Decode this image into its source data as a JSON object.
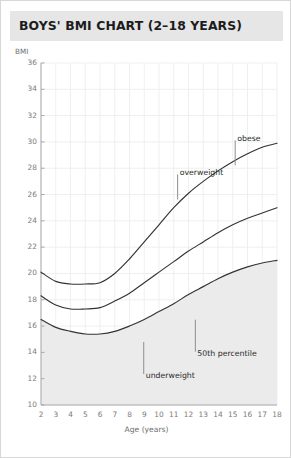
{
  "header": {
    "title": "BOYS' BMI CHART (2–18 YEARS)",
    "band_color": "#e6e6e6"
  },
  "chart_data": {
    "type": "line",
    "title": "BOYS' BMI CHART (2–18 YEARS)",
    "xlabel": "Age (years)",
    "ylabel": "BMI",
    "xlim": [
      2,
      18
    ],
    "ylim": [
      10,
      36
    ],
    "grid": true,
    "grid_color": "#efefef",
    "legend": "none",
    "x_ticks": [
      2,
      3,
      4,
      5,
      6,
      7,
      8,
      9,
      10,
      11,
      12,
      13,
      14,
      15,
      16,
      17,
      18
    ],
    "y_ticks": [
      10,
      12,
      14,
      16,
      18,
      20,
      22,
      24,
      26,
      28,
      30,
      32,
      34,
      36
    ],
    "x": [
      2,
      3,
      4,
      5,
      6,
      7,
      8,
      9,
      10,
      11,
      12,
      13,
      14,
      15,
      16,
      17,
      18
    ],
    "series": [
      {
        "name": "obese",
        "label": "obese",
        "color": "#333333",
        "values": [
          20.1,
          19.4,
          19.2,
          19.2,
          19.3,
          20.0,
          21.1,
          22.4,
          23.7,
          25.0,
          26.1,
          27.0,
          27.8,
          28.5,
          29.1,
          29.6,
          29.9
        ]
      },
      {
        "name": "overweight",
        "label": "overweight",
        "color": "#333333",
        "values": [
          18.3,
          17.6,
          17.3,
          17.3,
          17.4,
          17.9,
          18.5,
          19.3,
          20.1,
          20.9,
          21.7,
          22.4,
          23.1,
          23.7,
          24.2,
          24.6,
          25.0
        ]
      },
      {
        "name": "50th percentile",
        "label": "50th percentile",
        "color": "#333333",
        "values": [
          16.5,
          15.9,
          15.6,
          15.4,
          15.4,
          15.6,
          16.0,
          16.5,
          17.1,
          17.7,
          18.4,
          19.0,
          19.6,
          20.1,
          20.5,
          20.8,
          21.0
        ]
      }
    ],
    "bands": [
      {
        "name": "underweight-band",
        "label": "underweight",
        "fill": "#ebebeb",
        "description": "shaded region below the 50th percentile curve"
      }
    ],
    "annotations": [
      {
        "name": "obese",
        "text": "obese",
        "x": 15.3,
        "y": 30.2,
        "leader": "down"
      },
      {
        "name": "overweight",
        "text": "overweight",
        "x": 11.4,
        "y": 27.6,
        "leader": "down"
      },
      {
        "name": "50th-percentile",
        "text": "50th percentile",
        "x": 12.6,
        "y": 13.9,
        "leader": "up"
      },
      {
        "name": "underweight",
        "text": "underweight",
        "x": 9.1,
        "y": 12.2,
        "leader": "up"
      }
    ]
  }
}
